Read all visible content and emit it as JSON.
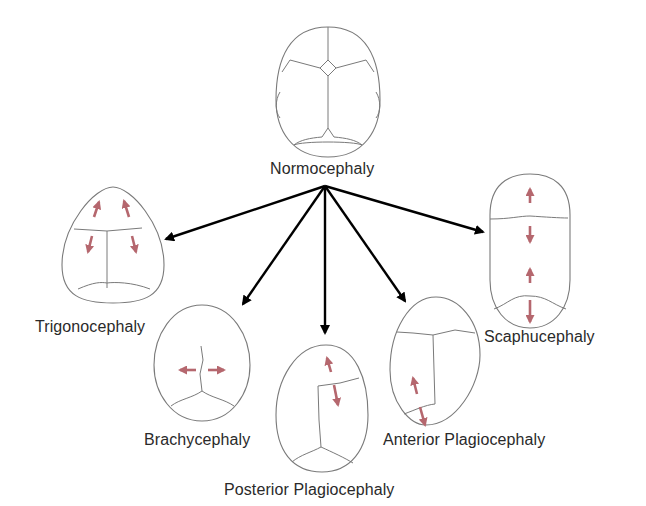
{
  "diagram": {
    "type": "head-shape classification tree",
    "root": {
      "id": "normocephaly",
      "label": "Normocephaly"
    },
    "children": [
      {
        "id": "trigonocephaly",
        "label": "Trigonocephaly",
        "growth_arrows": "diverging at frontal region"
      },
      {
        "id": "brachycephaly",
        "label": "Brachycephaly",
        "growth_arrows": "lateral widening"
      },
      {
        "id": "posterior_plagiocephaly",
        "label": "Posterior Plagiocephaly",
        "growth_arrows": "oblique, one side"
      },
      {
        "id": "anterior_plagiocephaly",
        "label": "Anterior Plagiocephaly",
        "growth_arrows": "oblique, anterior"
      },
      {
        "id": "scaphucephaly",
        "label": "Scaphucephaly",
        "growth_arrows": "longitudinal elongation"
      }
    ],
    "colors": {
      "skull_outline": "#7a7a7a",
      "flow_arrow": "#000000",
      "growth_arrow": "#b5676e",
      "label_text": "#2a2a2a",
      "background": "#ffffff"
    }
  }
}
